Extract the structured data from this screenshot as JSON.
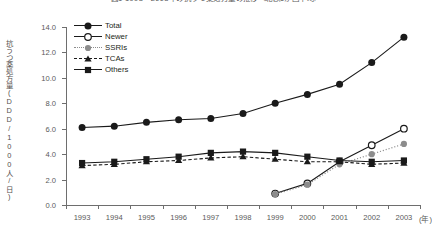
{
  "title": "図1 1993～2003年の抗うつ薬処方量の推移（北欧5か国平均）",
  "y_axis_title": "抗うつ薬処方量(DDD/1000人/日)",
  "x_unit": "(年)",
  "legend": [
    {
      "label": "Total",
      "marker": "filled-circle",
      "line": "solid",
      "color": "#1a1a1a"
    },
    {
      "label": "Newer",
      "marker": "open-circle",
      "line": "solid",
      "color": "#1a1a1a"
    },
    {
      "label": "SSRIs",
      "marker": "gray-circle",
      "line": "dotted",
      "color": "#8c8c8c"
    },
    {
      "label": "TCAs",
      "marker": "filled-triangle",
      "line": "dashed",
      "color": "#1a1a1a"
    },
    {
      "label": "Others",
      "marker": "filled-square",
      "line": "solid",
      "color": "#1a1a1a"
    }
  ],
  "chart_data": {
    "type": "line",
    "title": "図1 1993～2003年の抗うつ薬処方量の推移（北欧5か国平均）",
    "xlabel": "(年)",
    "ylabel": "抗うつ薬処方量(DDD/1000人/日)",
    "categories": [
      "1993",
      "1994",
      "1995",
      "1996",
      "1997",
      "1998",
      "1999",
      "2000",
      "2001",
      "2002",
      "2003"
    ],
    "ylim": [
      0.0,
      14.0
    ],
    "ytick_labels": [
      "0.0",
      "2.0",
      "4.0",
      "6.0",
      "8.0",
      "10.0",
      "12.0",
      "14.0"
    ],
    "ytick_values": [
      0.0,
      2.0,
      4.0,
      6.0,
      8.0,
      10.0,
      12.0,
      14.0
    ],
    "grid": false,
    "legend_position": "top-left-inside",
    "series": [
      {
        "name": "Total",
        "marker": "filled-circle",
        "line": "solid",
        "color": "#1a1a1a",
        "values": [
          6.1,
          6.2,
          6.5,
          6.7,
          6.8,
          7.2,
          8.0,
          8.7,
          9.5,
          11.2,
          13.2
        ]
      },
      {
        "name": "Newer",
        "marker": "open-circle",
        "line": "solid",
        "color": "#1a1a1a",
        "values": [
          null,
          null,
          null,
          null,
          null,
          null,
          0.9,
          1.7,
          3.4,
          4.7,
          6.0
        ]
      },
      {
        "name": "SSRIs",
        "marker": "gray-circle",
        "line": "dotted",
        "color": "#8c8c8c",
        "values": [
          null,
          null,
          null,
          null,
          null,
          null,
          0.85,
          1.6,
          3.2,
          4.0,
          4.8
        ]
      },
      {
        "name": "TCAs",
        "marker": "filled-triangle",
        "line": "dashed",
        "color": "#1a1a1a",
        "values": [
          3.1,
          3.2,
          3.4,
          3.5,
          3.7,
          3.8,
          3.6,
          3.4,
          3.4,
          3.2,
          3.3
        ]
      },
      {
        "name": "Others",
        "marker": "filled-square",
        "line": "solid",
        "color": "#1a1a1a",
        "values": [
          3.3,
          3.4,
          3.6,
          3.8,
          4.1,
          4.2,
          4.1,
          3.8,
          3.5,
          3.4,
          3.5
        ]
      }
    ]
  }
}
